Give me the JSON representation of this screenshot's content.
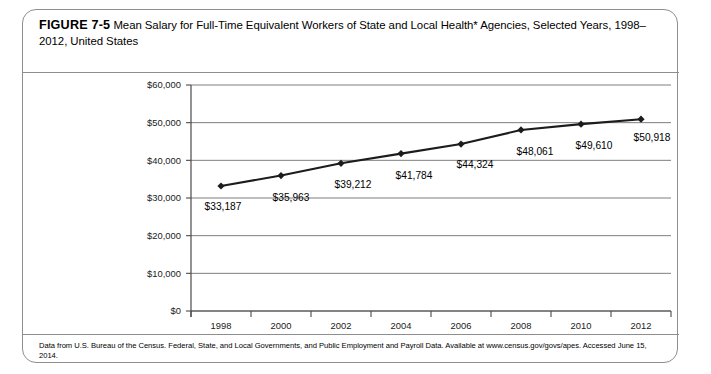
{
  "figure": {
    "number_label": "FIGURE 7-5",
    "caption": "Mean Salary for Full-Time Equivalent Workers of State and Local Health* Agencies, Selected Years, 1998–2012, United States",
    "footnote": "Data from U.S. Bureau of the Census. Federal, State, and Local Governments, and Public Employment and Payroll Data. Available at www.census.gov/govs/apes. Accessed June 15, 2014."
  },
  "chart_data": {
    "type": "line",
    "title": "",
    "xlabel": "",
    "ylabel": "",
    "categories": [
      "1998",
      "2000",
      "2002",
      "2004",
      "2006",
      "2008",
      "2010",
      "2012"
    ],
    "values": [
      33187,
      35963,
      39212,
      41784,
      44324,
      48061,
      49610,
      50918
    ],
    "point_labels": [
      "$33,187",
      "$35,963",
      "$39,212",
      "$41,784",
      "$44,324",
      "$48,061",
      "$49,610",
      "$50,918"
    ],
    "ylim": [
      0,
      60000
    ],
    "ytick_values": [
      0,
      10000,
      20000,
      30000,
      40000,
      50000,
      60000
    ],
    "ytick_labels": [
      "$0",
      "$10,000",
      "$20,000",
      "$30,000",
      "$40,000",
      "$50,000",
      "$60,000"
    ],
    "xtick_labels": [
      "1998",
      "2000",
      "2002",
      "2004",
      "2006",
      "2008",
      "2010",
      "2012"
    ],
    "grid": true,
    "legend": "none",
    "marker": "diamond",
    "series_color": "#1c1c1c"
  }
}
